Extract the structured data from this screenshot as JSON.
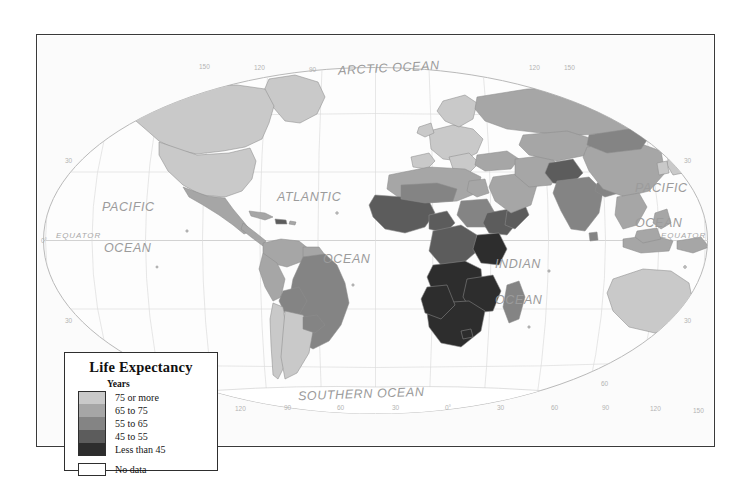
{
  "map": {
    "title": "World Life Expectancy Choropleth Map",
    "ocean_labels": [
      {
        "name": "arctic-ocean",
        "text": "ARCTIC OCEAN",
        "x": 337,
        "y": 60,
        "size": "lg",
        "rot": -3
      },
      {
        "name": "pacific-ocean-west",
        "text": "PACIFIC",
        "x": 101,
        "y": 199,
        "size": "lg",
        "rot": 0
      },
      {
        "name": "pacific-ocean-west-2",
        "text": "OCEAN",
        "x": 103,
        "y": 240,
        "size": "lg",
        "rot": 0
      },
      {
        "name": "atlantic-ocean",
        "text": "ATLANTIC",
        "x": 276,
        "y": 189,
        "size": "lg",
        "rot": 0
      },
      {
        "name": "atlantic-ocean-2",
        "text": "OCEAN",
        "x": 322,
        "y": 251,
        "size": "lg",
        "rot": 0
      },
      {
        "name": "indian-ocean",
        "text": "INDIAN",
        "x": 494,
        "y": 256,
        "size": "lg",
        "rot": 0
      },
      {
        "name": "indian-ocean-2",
        "text": "OCEAN",
        "x": 494,
        "y": 292,
        "size": "lg",
        "rot": 0
      },
      {
        "name": "pacific-ocean-east",
        "text": "PACIFIC",
        "x": 634,
        "y": 180,
        "size": "lg",
        "rot": 0
      },
      {
        "name": "pacific-ocean-east-2",
        "text": "OCEAN",
        "x": 634,
        "y": 215,
        "size": "lg",
        "rot": 0
      },
      {
        "name": "southern-ocean",
        "text": "SOUTHERN OCEAN",
        "x": 297,
        "y": 386,
        "size": "lg",
        "rot": -2
      },
      {
        "name": "equator-label-west",
        "text": "EQUATOR",
        "x": 55,
        "y": 230,
        "size": "sm",
        "rot": 0
      },
      {
        "name": "equator-label-east",
        "text": "EQUATOR",
        "x": 660,
        "y": 230,
        "size": "sm",
        "rot": 0
      }
    ],
    "graticule_top": [
      {
        "text": "150",
        "x": 198,
        "y": 62
      },
      {
        "text": "120",
        "x": 253,
        "y": 63
      },
      {
        "text": "90",
        "x": 308,
        "y": 65
      },
      {
        "text": "120",
        "x": 528,
        "y": 63
      },
      {
        "text": "150",
        "x": 563,
        "y": 63
      }
    ],
    "graticule_bottom": [
      {
        "text": "150",
        "x": 199,
        "y": 406
      },
      {
        "text": "120",
        "x": 234,
        "y": 404
      },
      {
        "text": "90",
        "x": 283,
        "y": 403
      },
      {
        "text": "60",
        "x": 336,
        "y": 403
      },
      {
        "text": "30",
        "x": 391,
        "y": 403
      },
      {
        "text": "0°",
        "x": 444,
        "y": 403
      },
      {
        "text": "30",
        "x": 496,
        "y": 403
      },
      {
        "text": "60",
        "x": 550,
        "y": 403
      },
      {
        "text": "90",
        "x": 601,
        "y": 403
      },
      {
        "text": "120",
        "x": 649,
        "y": 404
      },
      {
        "text": "150",
        "x": 692,
        "y": 406
      }
    ],
    "graticule_left": [
      {
        "text": "30",
        "x": 64,
        "y": 156
      },
      {
        "text": "0°",
        "x": 40,
        "y": 236
      },
      {
        "text": "30",
        "x": 64,
        "y": 316
      },
      {
        "text": "60",
        "x": 127,
        "y": 378
      }
    ],
    "graticule_right": [
      {
        "text": "30",
        "x": 683,
        "y": 156
      },
      {
        "text": "30",
        "x": 683,
        "y": 316
      },
      {
        "text": "60",
        "x": 600,
        "y": 379
      }
    ]
  },
  "legend": {
    "title": "Life Expectancy",
    "subtitle": "Years",
    "classes": [
      {
        "label": "75 or more",
        "color": "#c9c9c9"
      },
      {
        "label": "65 to 75",
        "color": "#a6a6a6"
      },
      {
        "label": "55 to 65",
        "color": "#848484"
      },
      {
        "label": "45 to 55",
        "color": "#5c5c5c"
      },
      {
        "label": "Less than 45",
        "color": "#2d2d2d"
      }
    ],
    "nodata_label": "No data",
    "nodata_color": "#ffffff"
  },
  "chart_data": {
    "type": "map",
    "title": "Life Expectancy",
    "unit": "Years",
    "legend_position": "bottom-left",
    "projection": "Robinson / oval world projection",
    "classes": [
      "75 or more",
      "65 to 75",
      "55 to 65",
      "45 to 55",
      "Less than 45",
      "No data"
    ],
    "class_colors": [
      "#c9c9c9",
      "#a6a6a6",
      "#848484",
      "#5c5c5c",
      "#2d2d2d",
      "#ffffff"
    ],
    "regions": [
      {
        "name": "Canada",
        "class": "75 or more"
      },
      {
        "name": "United States",
        "class": "75 or more"
      },
      {
        "name": "Greenland",
        "class": "75 or more"
      },
      {
        "name": "Mexico",
        "class": "65 to 75"
      },
      {
        "name": "Central America",
        "class": "65 to 75"
      },
      {
        "name": "Caribbean",
        "class": "65 to 75"
      },
      {
        "name": "Haiti",
        "class": "45 to 55"
      },
      {
        "name": "Brazil",
        "class": "55 to 65"
      },
      {
        "name": "Bolivia",
        "class": "55 to 65"
      },
      {
        "name": "Peru",
        "class": "65 to 75"
      },
      {
        "name": "Colombia",
        "class": "65 to 75"
      },
      {
        "name": "Venezuela",
        "class": "65 to 75"
      },
      {
        "name": "Argentina",
        "class": "75 or more"
      },
      {
        "name": "Chile",
        "class": "75 or more"
      },
      {
        "name": "Western Europe",
        "class": "75 or more"
      },
      {
        "name": "Russia",
        "class": "65 to 75"
      },
      {
        "name": "North Africa",
        "class": "65 to 75"
      },
      {
        "name": "West Africa",
        "class": "45 to 55"
      },
      {
        "name": "Nigeria",
        "class": "45 to 55"
      },
      {
        "name": "Central Africa",
        "class": "45 to 55"
      },
      {
        "name": "Ethiopia",
        "class": "45 to 55"
      },
      {
        "name": "Southern Africa",
        "class": "Less than 45"
      },
      {
        "name": "Zambia",
        "class": "Less than 45"
      },
      {
        "name": "Zimbabwe",
        "class": "Less than 45"
      },
      {
        "name": "Mozambique",
        "class": "Less than 45"
      },
      {
        "name": "Angola",
        "class": "Less than 45"
      },
      {
        "name": "Madagascar",
        "class": "55 to 65"
      },
      {
        "name": "Middle East",
        "class": "65 to 75"
      },
      {
        "name": "Afghanistan",
        "class": "45 to 55"
      },
      {
        "name": "India",
        "class": "55 to 65"
      },
      {
        "name": "China",
        "class": "65 to 75"
      },
      {
        "name": "Mongolia",
        "class": "65 to 75"
      },
      {
        "name": "Southeast Asia",
        "class": "65 to 75"
      },
      {
        "name": "Japan",
        "class": "75 or more"
      },
      {
        "name": "Australia",
        "class": "75 or more"
      },
      {
        "name": "New Zealand",
        "class": "75 or more"
      },
      {
        "name": "Antarctica",
        "class": "No data"
      }
    ]
  }
}
